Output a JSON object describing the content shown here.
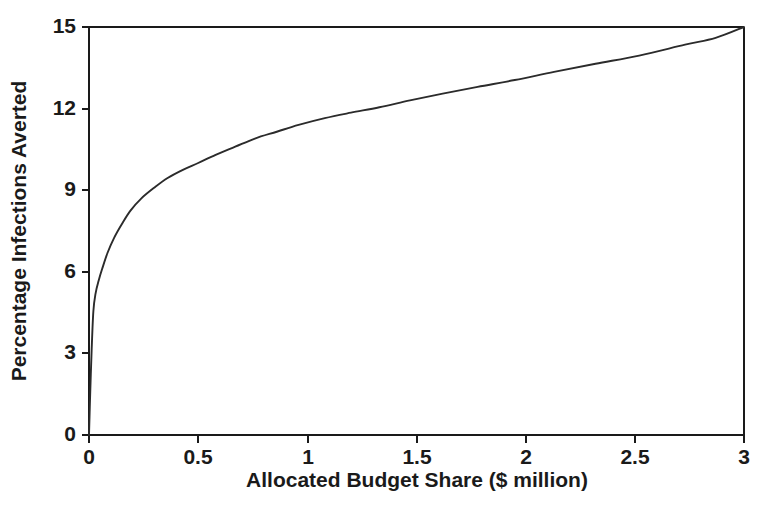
{
  "chart_data": {
    "type": "line",
    "title": "",
    "xlabel": "Allocated Budget Share ($ million)",
    "ylabel": "Percentage Infections Averted",
    "xlim": [
      0,
      3
    ],
    "ylim": [
      0,
      15
    ],
    "xticks": [
      0,
      0.5,
      1,
      1.5,
      2,
      2.5,
      3
    ],
    "xticklabels": [
      "0",
      "0.5",
      "1",
      "1.5",
      "2",
      "2.5",
      "3"
    ],
    "yticks": [
      0,
      3,
      6,
      9,
      12,
      15
    ],
    "yticklabels": [
      "0",
      "3",
      "6",
      "9",
      "12",
      "15"
    ],
    "grid": false,
    "legend": null,
    "series": [
      {
        "name": "Percentage infections averted",
        "color": "#2b2b2b",
        "x": [
          0.0,
          0.005,
          0.012,
          0.02,
          0.03,
          0.045,
          0.06,
          0.085,
          0.115,
          0.15,
          0.19,
          0.24,
          0.3,
          0.36,
          0.43,
          0.5,
          0.58,
          0.67,
          0.76,
          0.86,
          0.96,
          1.08,
          1.2,
          1.33,
          1.47,
          1.62,
          1.78,
          1.95,
          2.13,
          2.32,
          2.52,
          2.73,
          2.87,
          3.0
        ],
        "y": [
          0.0,
          1.4,
          3.1,
          4.55,
          5.2,
          5.7,
          6.1,
          6.7,
          7.25,
          7.75,
          8.25,
          8.7,
          9.1,
          9.45,
          9.75,
          10.0,
          10.3,
          10.6,
          10.9,
          11.15,
          11.4,
          11.65,
          11.85,
          12.05,
          12.3,
          12.55,
          12.8,
          13.05,
          13.35,
          13.65,
          13.95,
          14.35,
          14.6,
          15.0
        ]
      }
    ]
  },
  "figure": {
    "plot_area": {
      "left_px": 89,
      "right_px": 744,
      "top_px": 27,
      "bottom_px": 435
    }
  }
}
